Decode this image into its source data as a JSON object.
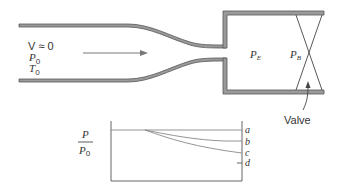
{
  "nozzle": {
    "inlet_labels": {
      "velocity": "V ≈ 0",
      "pressure": "P",
      "pressure_sub": "0",
      "temperature": "T",
      "temperature_sub": "0"
    },
    "exit_label": "P",
    "exit_label_sub": "E",
    "back_label": "P",
    "back_label_sub": "B",
    "valve_label": "Valve"
  },
  "plot": {
    "ylabel_num": "P",
    "ylabel_den": "P",
    "ylabel_den_sub": "0",
    "curves": [
      {
        "name": "a",
        "label": "a",
        "end_y_fraction": 1.0
      },
      {
        "name": "b",
        "label": "b"
      },
      {
        "name": "c",
        "label": "c"
      },
      {
        "name": "d",
        "label": "d"
      }
    ]
  },
  "colors": {
    "wall_fill": "#9a9a9a",
    "wall_stroke": "#555555",
    "line": "#777777",
    "text": "#333333"
  }
}
